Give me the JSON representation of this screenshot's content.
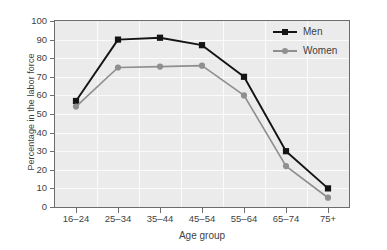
{
  "chart_data": {
    "type": "line",
    "title": "",
    "xlabel": "Age group",
    "ylabel": "Percentage in the labor force",
    "categories": [
      "16–24",
      "25–34",
      "35–44",
      "45–54",
      "55–64",
      "65–74",
      "75+"
    ],
    "series": [
      {
        "name": "Men",
        "values": [
          57,
          90,
          91,
          87,
          70,
          30,
          10
        ],
        "color": "#141414",
        "marker": "square"
      },
      {
        "name": "Women",
        "values": [
          54,
          75,
          75.5,
          76,
          60,
          22,
          5
        ],
        "color": "#8f8f8f",
        "marker": "circle"
      }
    ],
    "ylim": [
      0,
      100
    ],
    "ytick_labels": [
      "0",
      "10",
      "20",
      "30",
      "40",
      "50",
      "60",
      "70",
      "80",
      "90",
      "100"
    ],
    "ytick_values": [
      0,
      10,
      20,
      30,
      40,
      50,
      60,
      70,
      80,
      90,
      100
    ],
    "grid": true,
    "legend_position": "top-right",
    "plot_background": "#ebebeb",
    "gridline_color": "#fbfbfb",
    "axis_color": "#6d6d6d"
  },
  "legend": {
    "entries": [
      {
        "label": "Men"
      },
      {
        "label": "Women"
      }
    ]
  }
}
